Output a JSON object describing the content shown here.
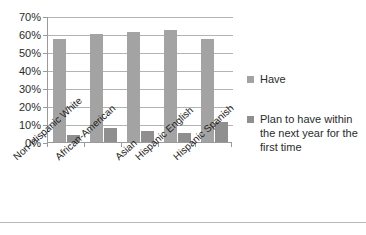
{
  "chart_data": {
    "type": "bar",
    "title": "",
    "subtitle": "",
    "xlabel": "",
    "ylabel": "",
    "grid": true,
    "legend_position": "right",
    "ylim": [
      0,
      70
    ],
    "y_unit": "%",
    "y_ticks": [
      "70%",
      "60%",
      "50%",
      "40%",
      "30%",
      "20%",
      "10%",
      "0%"
    ],
    "y_tick_values": [
      70,
      60,
      50,
      40,
      30,
      20,
      10,
      0
    ],
    "categories": [
      "Non-Hispanic White",
      "African-American",
      "Asian",
      "Hispanic English",
      "Hispanic Spanish"
    ],
    "series": [
      {
        "name": "Have",
        "color": "#a3a3a3",
        "values": [
          57,
          60,
          61,
          62,
          57
        ]
      },
      {
        "name": "Plan to have within the next year for the first time",
        "color": "#8f8f8f",
        "values": [
          4,
          8,
          6,
          5,
          11
        ]
      }
    ]
  },
  "legend": {
    "items": [
      {
        "label": "Have",
        "color": "#a3a3a3"
      },
      {
        "label": "Plan to have within the next year for the first time",
        "color": "#8f8f8f"
      }
    ]
  },
  "colors": {
    "series_have": "#a3a3a3",
    "series_plan": "#8f8f8f",
    "gridline": "#b3b3b3",
    "axis": "#9a9a9a",
    "text": "#2b2b2b",
    "background": "#ffffff"
  }
}
